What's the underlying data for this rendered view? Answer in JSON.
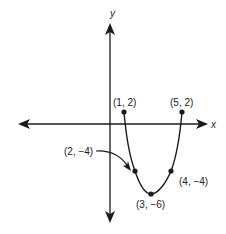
{
  "diagram": {
    "type": "coordinate-graph",
    "axes": {
      "x_label": "x",
      "y_label": "y"
    },
    "curve": {
      "description": "parabola-like U-shaped curve with endpoints",
      "points": [
        {
          "label": "(1, 2)",
          "x": 1,
          "y": 2,
          "role": "endpoint"
        },
        {
          "label": "(2, −4)",
          "x": 2,
          "y": -4,
          "role": "point"
        },
        {
          "label": "(3, −6)",
          "x": 3,
          "y": -6,
          "role": "vertex"
        },
        {
          "label": "(4, −4)",
          "x": 4,
          "y": -4,
          "role": "point"
        },
        {
          "label": "(5, 2)",
          "x": 5,
          "y": 2,
          "role": "endpoint"
        }
      ]
    },
    "callout": {
      "label": "(2, −4)",
      "points_to": "(2, -4)"
    },
    "colors": {
      "line": "#1a1a1a",
      "background": "#ffffff"
    }
  }
}
